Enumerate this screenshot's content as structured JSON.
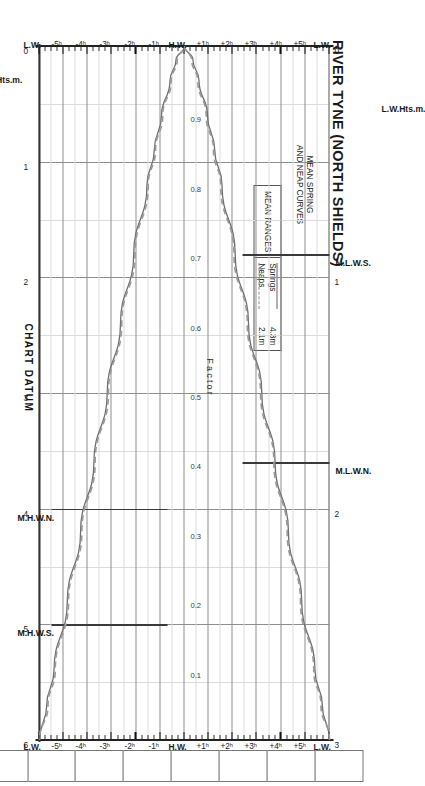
{
  "title": "RIVER TYNE (NORTH SHIELDS)",
  "subtitle_line1": "MEAN SPRING",
  "subtitle_line2": "AND NEAP CURVES",
  "legend": {
    "header": "MEAN RANGES",
    "rows": [
      {
        "label": "Springs",
        "value": "4.3m",
        "style": "solid"
      },
      {
        "label": "Neaps",
        "value": "2.1m",
        "style": "dashed"
      }
    ]
  },
  "axes": {
    "hour_axis_labels": [
      "L.W.",
      "+5ʰ",
      "+4ʰ",
      "+3ʰ",
      "+2ʰ",
      "+1ʰ",
      "H.W.",
      "-1ʰ",
      "-2ʰ",
      "-3ʰ",
      "-4ʰ",
      "-5ʰ",
      "L.W."
    ],
    "left_scale_name": "H.W.Hts.m.",
    "right_scale_name": "L.W.Hts.m.",
    "left_scale_ticks": [
      "0",
      "1",
      "2",
      "3",
      "4",
      "5",
      "6"
    ],
    "right_scale_ticks": [
      "0",
      "1",
      "2",
      "3"
    ],
    "factor_word": "Factor",
    "factor_ticks": [
      "0.9",
      "0.8",
      "0.7",
      "0.6",
      "0.5",
      "0.4",
      "0.3",
      "0.2",
      "0.1"
    ],
    "chart_datum": "CHART DATUM"
  },
  "levels": [
    {
      "name": "M.H.W.S.",
      "value": 5.0
    },
    {
      "name": "M.H.W.N.",
      "value": 4.0
    },
    {
      "name": "M.L.W.N.",
      "value": 1.8
    },
    {
      "name": "M.L.W.S.",
      "value": 0.9
    }
  ],
  "colors": {
    "springs_curve": "#6e6e6e",
    "neaps_curve": "#9a9a9a",
    "grid_major": "#8e8e8e",
    "grid_minor": "#dcdcdc",
    "axis": "#222222"
  },
  "chart_data": {
    "type": "line",
    "xlabel": "Factor",
    "ylabel": "Hours from High Water",
    "xlim": [
      0,
      1
    ],
    "ylim": [
      -6,
      6
    ],
    "grid": true,
    "legend_position": "top-left",
    "x": [
      1.0,
      0.98,
      0.95,
      0.9,
      0.85,
      0.8,
      0.7,
      0.6,
      0.5,
      0.4,
      0.3,
      0.2,
      0.1,
      0.05,
      0.0
    ],
    "series": [
      {
        "name": "Springs 4.3m",
        "style": "solid",
        "hours_rising": [
          0.0,
          -0.35,
          -0.6,
          -0.95,
          -1.25,
          -1.55,
          -2.1,
          -2.65,
          -3.2,
          -3.75,
          -4.3,
          -4.85,
          -5.4,
          -5.7,
          -6.0
        ],
        "hours_falling": [
          0.0,
          0.35,
          0.6,
          0.95,
          1.25,
          1.55,
          2.1,
          2.65,
          3.2,
          3.75,
          4.3,
          4.85,
          5.4,
          5.7,
          6.0
        ]
      },
      {
        "name": "Neaps 2.1m",
        "style": "dashed",
        "hours_rising": [
          0.0,
          -0.3,
          -0.55,
          -0.9,
          -1.2,
          -1.5,
          -2.05,
          -2.6,
          -3.15,
          -3.7,
          -4.25,
          -4.8,
          -5.35,
          -5.65,
          -6.0
        ],
        "hours_falling": [
          0.0,
          0.3,
          0.55,
          0.9,
          1.2,
          1.5,
          2.05,
          2.6,
          3.15,
          3.7,
          4.25,
          4.8,
          5.35,
          5.65,
          6.0
        ]
      }
    ],
    "annotations": [
      {
        "text": "M.H.W.S.",
        "height_m": 5.0,
        "scale": "H.W."
      },
      {
        "text": "M.H.W.N.",
        "height_m": 4.0,
        "scale": "H.W."
      },
      {
        "text": "M.L.W.N.",
        "height_m": 1.8,
        "scale": "L.W."
      },
      {
        "text": "M.L.W.S.",
        "height_m": 0.9,
        "scale": "L.W."
      },
      {
        "text": "CHART DATUM",
        "height_m": 0.0,
        "scale": "both"
      }
    ]
  },
  "time_boxes": {
    "count": 13,
    "values": [
      "",
      "",
      "",
      "",
      "",
      "",
      "",
      "",
      "",
      "",
      "",
      "",
      ""
    ]
  }
}
